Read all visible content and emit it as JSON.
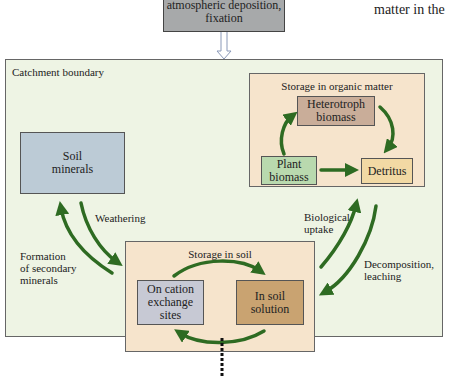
{
  "input_box": {
    "line1": "atmospheric deposition,",
    "line2": "fixation"
  },
  "fragment_text": "matter in the",
  "catchment": {
    "label": "Catchment boundary"
  },
  "organic_storage": {
    "label": "Storage in organic matter",
    "heterotroph": {
      "line1": "Heterotroph",
      "line2": "biomass"
    },
    "plant": {
      "line1": "Plant",
      "line2": "biomass"
    },
    "detritus": "Detritus"
  },
  "soil_minerals": {
    "line1": "Soil",
    "line2": "minerals"
  },
  "soil_storage": {
    "label": "Storage in soil",
    "cation": {
      "line1": "On cation",
      "line2": "exchange",
      "line3": "sites"
    },
    "solution": {
      "line1": "In soil",
      "line2": "solution"
    }
  },
  "flows": {
    "weathering": "Weathering",
    "secondary": {
      "line1": "Formation",
      "line2": "of secondary",
      "line3": "minerals"
    },
    "uptake": {
      "line1": "Biological",
      "line2": "uptake"
    },
    "decomposition": {
      "line1": "Decomposition,",
      "line2": "leaching"
    }
  },
  "colors": {
    "arrow": "#2e6b22",
    "background": "#eef4e4"
  }
}
